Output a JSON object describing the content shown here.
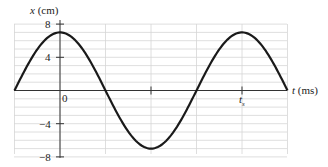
{
  "chart_data": {
    "type": "line",
    "title": "",
    "xlabel": "t (ms)",
    "ylabel": "x (cm)",
    "xlabel_var": "t",
    "xlabel_unit": "(ms)",
    "ylabel_var": "x",
    "ylabel_unit": "(cm)",
    "y_ticks": [
      8,
      4,
      0,
      -4,
      -8
    ],
    "y_tick_labels": [
      "8",
      "4",
      "0",
      "−4",
      "−8"
    ],
    "x_ticks_labels": [
      {
        "label": "0",
        "t_fraction_of_period": 0
      },
      {
        "label": "t",
        "subscript": "s",
        "t_fraction_of_period": 1
      }
    ],
    "ylim": [
      -8,
      8
    ],
    "xlim_fraction_of_period": [
      -0.25,
      1.25
    ],
    "grid": true,
    "legend": null,
    "series": [
      {
        "name": "x(t)",
        "description": "Cosine oscillation, amplitude ≈ 7 cm, period t_s",
        "amplitude": 7,
        "points": [
          {
            "t_fraction": -0.25,
            "x": 0
          },
          {
            "t_fraction": 0,
            "x": 7
          },
          {
            "t_fraction": 0.25,
            "x": 0
          },
          {
            "t_fraction": 0.5,
            "x": -7
          },
          {
            "t_fraction": 0.75,
            "x": 0
          },
          {
            "t_fraction": 1.0,
            "x": 7
          },
          {
            "t_fraction": 1.25,
            "x": 0
          }
        ]
      }
    ],
    "colors": {
      "curve": "#1a1a1a",
      "grid": "#d6d6d6",
      "axis": "#333333"
    }
  }
}
